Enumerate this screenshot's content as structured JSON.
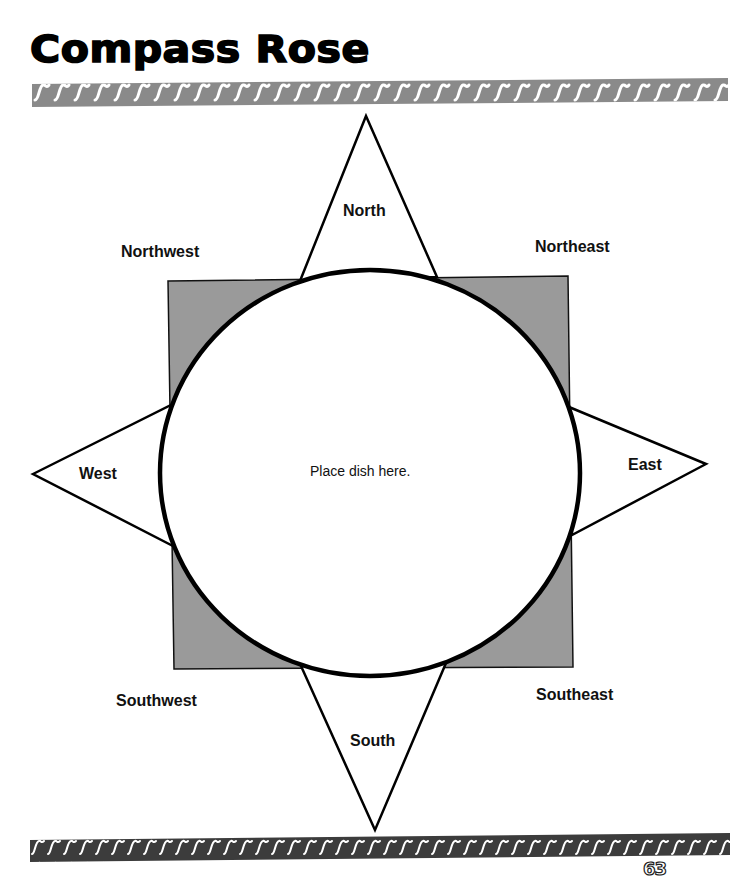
{
  "page": {
    "title": "Compass Rose",
    "page_number": "63"
  },
  "compass": {
    "center_instruction": "Place dish here.",
    "cardinal": {
      "north": "North",
      "south": "South",
      "east": "East",
      "west": "West"
    },
    "intercardinal": {
      "northwest": "Northwest",
      "northeast": "Northeast",
      "southwest": "Southwest",
      "southeast": "Southeast"
    }
  },
  "colors": {
    "top_band": "#8a8a8a",
    "bottom_band": "#3c3c3c",
    "square_fill": "#9a9a9a",
    "stroke": "#000000"
  }
}
